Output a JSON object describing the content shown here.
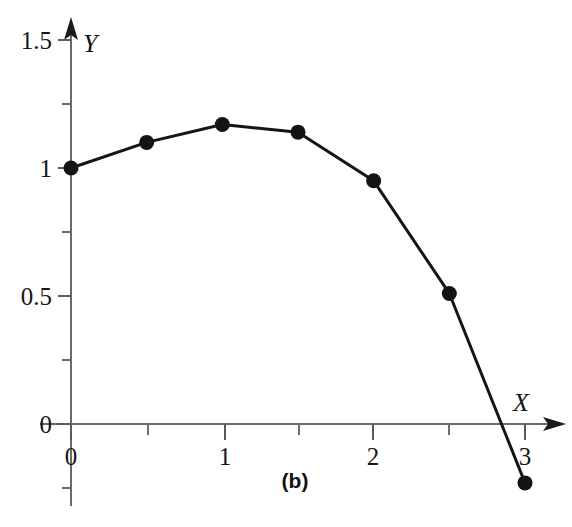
{
  "chart_data": {
    "type": "line",
    "title": "",
    "subtitle": "",
    "caption": "(b)",
    "xlabel": "X",
    "ylabel": "Y",
    "x": [
      0,
      0.5,
      1,
      1.5,
      2,
      2.5,
      3
    ],
    "values": [
      1.0,
      1.1,
      1.17,
      1.14,
      0.95,
      0.51,
      -0.23
    ],
    "series": [
      {
        "name": "curve",
        "x": [
          0,
          0.5,
          1,
          1.5,
          2,
          2.5,
          3
        ],
        "values": [
          1.0,
          1.1,
          1.17,
          1.14,
          0.95,
          0.51,
          -0.23
        ]
      }
    ],
    "xlim": [
      0,
      3.2
    ],
    "ylim": [
      -0.32,
      1.62
    ],
    "x_ticks_major": [
      0,
      1,
      2,
      3
    ],
    "x_ticks_minor": [
      0.5,
      1.5,
      2.5
    ],
    "x_tick_labels": [
      "0",
      "1",
      "2",
      "3"
    ],
    "y_ticks_major": [
      0,
      0.5,
      1,
      1.5
    ],
    "y_ticks_minor": [
      -0.25,
      0.25,
      0.75,
      1.25
    ],
    "y_tick_labels": [
      "0",
      "0.5",
      "1",
      "1.5"
    ],
    "grid": false,
    "legend": false,
    "legend_position": "none",
    "marker": "filled-circle",
    "line_color": "#151515",
    "marker_color": "#141414",
    "axis_color": "#5a5a5a",
    "zero_crossing_x": 2.87
  },
  "axes": {
    "x_name": "X",
    "y_name": "Y",
    "x_tick_labels": [
      {
        "text": "0",
        "x": 71
      },
      {
        "text": "1",
        "x": 225
      },
      {
        "text": "2",
        "x": 373
      },
      {
        "text": "3",
        "x": 525
      }
    ],
    "y_tick_labels": [
      {
        "text": "1.5",
        "y": 40
      },
      {
        "text": "1",
        "y": 168
      },
      {
        "text": "0.5",
        "y": 296
      },
      {
        "text": "0",
        "y": 424
      }
    ]
  },
  "figure": {
    "caption": "(b)"
  }
}
